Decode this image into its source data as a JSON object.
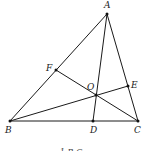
{
  "diagram": {
    "type": "triangle-cevians",
    "stroke_color": "#1a1a1a",
    "points": {
      "A": {
        "label": "A",
        "x": 107,
        "y": 14
      },
      "B": {
        "label": "B",
        "x": 10,
        "y": 121
      },
      "C": {
        "label": "C",
        "x": 138,
        "y": 121
      },
      "D": {
        "label": "D",
        "x": 93,
        "y": 121
      },
      "E": {
        "label": "E",
        "x": 128,
        "y": 86
      },
      "F": {
        "label": "F",
        "x": 56,
        "y": 70
      },
      "O": {
        "label": "O",
        "x": 96,
        "y": 95
      }
    },
    "segments": [
      [
        "A",
        "B"
      ],
      [
        "B",
        "C"
      ],
      [
        "C",
        "A"
      ],
      [
        "A",
        "D"
      ],
      [
        "B",
        "E"
      ],
      [
        "C",
        "F"
      ]
    ],
    "caption": "1-B-C"
  }
}
